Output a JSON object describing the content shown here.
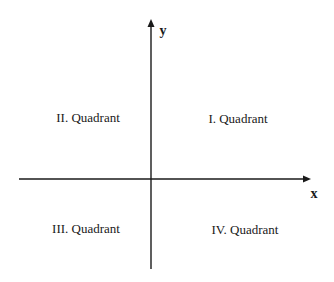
{
  "diagram": {
    "title": "",
    "axes": {
      "x_label": "x",
      "y_label": "y"
    },
    "quadrants": [
      {
        "id": "I",
        "label": "I. Quadrant"
      },
      {
        "id": "II",
        "label": "II. Quadrant"
      },
      {
        "id": "III",
        "label": "III. Quadrant"
      },
      {
        "id": "IV",
        "label": "IV. Quadrant"
      }
    ],
    "colors": {
      "axis": "#1a1a1a",
      "background": "#ffffff"
    }
  }
}
